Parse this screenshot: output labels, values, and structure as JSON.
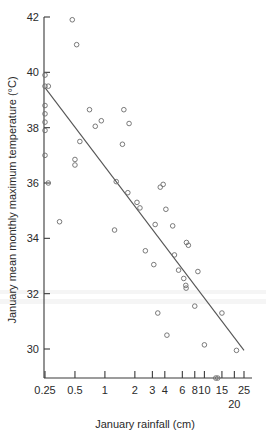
{
  "chart_data": {
    "type": "scatter",
    "title": "",
    "xlabel": "January rainfall (cm)",
    "ylabel": "January mean monthly maximum temperature (°C)",
    "xscale": "log",
    "yscale": "linear",
    "xlim": [
      0.22,
      27
    ],
    "ylim": [
      28.9,
      42.3
    ],
    "grid": false,
    "legend": null,
    "x_ticks": [
      {
        "value": 0.25,
        "label": "0.25"
      },
      {
        "value": 0.5,
        "label": "0.5"
      },
      {
        "value": 1,
        "label": "1"
      },
      {
        "value": 2,
        "label": "2"
      },
      {
        "value": 3,
        "label": "3"
      },
      {
        "value": 4,
        "label": "4"
      },
      {
        "value": 6,
        "label": "6"
      },
      {
        "value": 8,
        "label": "8"
      },
      {
        "value": 10,
        "label": "10"
      },
      {
        "value": 15,
        "label": "15"
      },
      {
        "value": 20,
        "label": "20"
      },
      {
        "value": 25,
        "label": "25"
      }
    ],
    "y_ticks": [
      {
        "value": 30,
        "label": "30"
      },
      {
        "value": 32,
        "label": "32"
      },
      {
        "value": 34,
        "label": "34"
      },
      {
        "value": 36,
        "label": "36"
      },
      {
        "value": 38,
        "label": "38"
      },
      {
        "value": 40,
        "label": "40"
      },
      {
        "value": 42,
        "label": "42"
      }
    ],
    "series": [
      {
        "name": "stations",
        "marker": "open-circle",
        "color": "#6b6b6b",
        "points": [
          [
            0.25,
            39.9
          ],
          [
            0.25,
            39.5
          ],
          [
            0.27,
            39.5
          ],
          [
            0.25,
            38.8
          ],
          [
            0.25,
            38.5
          ],
          [
            0.25,
            38.2
          ],
          [
            0.25,
            37.9
          ],
          [
            0.25,
            37.0
          ],
          [
            0.27,
            36.0
          ],
          [
            0.35,
            34.6
          ],
          [
            0.47,
            41.9
          ],
          [
            0.52,
            41.0
          ],
          [
            0.5,
            36.85
          ],
          [
            0.5,
            36.65
          ],
          [
            0.56,
            37.5
          ],
          [
            0.7,
            38.65
          ],
          [
            0.8,
            38.05
          ],
          [
            0.92,
            38.25
          ],
          [
            1.25,
            34.3
          ],
          [
            1.3,
            36.05
          ],
          [
            1.5,
            37.4
          ],
          [
            1.55,
            38.65
          ],
          [
            1.7,
            35.65
          ],
          [
            1.75,
            38.15
          ],
          [
            2.1,
            35.3
          ],
          [
            2.25,
            35.1
          ],
          [
            2.55,
            33.55
          ],
          [
            3.1,
            33.05
          ],
          [
            3.2,
            34.5
          ],
          [
            3.4,
            31.3
          ],
          [
            3.6,
            35.85
          ],
          [
            3.85,
            35.95
          ],
          [
            4.1,
            35.05
          ],
          [
            4.2,
            30.5
          ],
          [
            4.8,
            34.45
          ],
          [
            5.0,
            33.4
          ],
          [
            5.5,
            32.85
          ],
          [
            6.6,
            33.85
          ],
          [
            6.9,
            33.75
          ],
          [
            6.5,
            32.3
          ],
          [
            6.55,
            32.2
          ],
          [
            6.2,
            32.55
          ],
          [
            8.0,
            31.55
          ],
          [
            8.6,
            32.8
          ],
          [
            10.0,
            30.15
          ],
          [
            13.0,
            28.95
          ],
          [
            13.6,
            28.95
          ],
          [
            15.0,
            31.3
          ],
          [
            21.0,
            29.95
          ]
        ]
      }
    ],
    "fit_line": {
      "name": "regression line",
      "color": "#555555",
      "x_start": 0.25,
      "y_start": 39.45,
      "x_end": 25.0,
      "y_end": 29.95
    }
  },
  "axis_titles": {
    "x": "January rainfall (cm)",
    "y": "January mean monthly maximum temperature (°C)"
  }
}
